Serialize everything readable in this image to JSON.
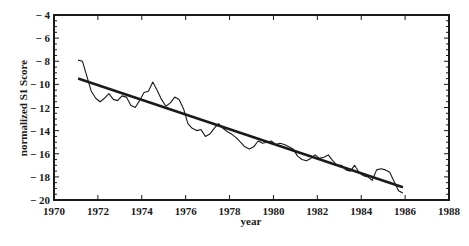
{
  "chart_data": {
    "type": "line",
    "title": "",
    "xlabel": "year",
    "ylabel": "normalized S1 Score",
    "xlim": [
      1970,
      1988
    ],
    "ylim": [
      -20,
      -4
    ],
    "xticks": [
      1970,
      1972,
      1974,
      1976,
      1978,
      1980,
      1982,
      1984,
      1986,
      1988
    ],
    "yticks": [
      -4,
      -6,
      -8,
      -10,
      -12,
      -14,
      -16,
      -18,
      -20
    ],
    "grid": false,
    "legend": null,
    "series": [
      {
        "name": "S1 score",
        "style": "thin-line",
        "x": [
          1971.1,
          1971.3,
          1971.5,
          1971.7,
          1971.9,
          1972.1,
          1972.3,
          1972.5,
          1972.7,
          1972.9,
          1973.1,
          1973.3,
          1973.5,
          1973.7,
          1973.9,
          1974.1,
          1974.3,
          1974.5,
          1974.7,
          1974.9,
          1975.1,
          1975.3,
          1975.5,
          1975.7,
          1975.9,
          1976.1,
          1976.3,
          1976.5,
          1976.7,
          1976.9,
          1977.1,
          1977.3,
          1977.5,
          1977.7,
          1977.9,
          1978.1,
          1978.3,
          1978.5,
          1978.7,
          1978.9,
          1979.1,
          1979.3,
          1979.5,
          1979.7,
          1979.9,
          1980.1,
          1980.3,
          1980.5,
          1980.7,
          1980.9,
          1981.1,
          1981.3,
          1981.5,
          1981.7,
          1981.9,
          1982.1,
          1982.3,
          1982.5,
          1982.7,
          1982.9,
          1983.1,
          1983.3,
          1983.5,
          1983.7,
          1983.9,
          1984.1,
          1984.3,
          1984.5,
          1984.7,
          1984.9,
          1985.1,
          1985.3,
          1985.5,
          1985.7,
          1985.9
        ],
        "y": [
          -7.9,
          -8.0,
          -9.3,
          -10.6,
          -11.2,
          -11.5,
          -11.2,
          -10.8,
          -11.3,
          -11.4,
          -11.0,
          -11.1,
          -11.8,
          -12.0,
          -11.4,
          -10.7,
          -10.6,
          -9.8,
          -10.5,
          -11.3,
          -11.9,
          -11.6,
          -11.1,
          -11.3,
          -12.1,
          -13.4,
          -13.8,
          -14.0,
          -13.9,
          -14.5,
          -14.3,
          -13.8,
          -13.4,
          -13.8,
          -14.1,
          -14.3,
          -14.6,
          -15.0,
          -15.4,
          -15.6,
          -15.4,
          -14.9,
          -15.1,
          -15.0,
          -14.9,
          -15.2,
          -15.1,
          -15.2,
          -15.4,
          -15.6,
          -16.2,
          -16.5,
          -16.6,
          -16.4,
          -16.1,
          -16.4,
          -16.3,
          -16.1,
          -16.6,
          -17.0,
          -17.0,
          -17.4,
          -17.5,
          -17.0,
          -17.6,
          -17.9,
          -18.0,
          -18.3,
          -17.4,
          -17.3,
          -17.4,
          -17.6,
          -18.4,
          -19.2,
          -19.4
        ]
      },
      {
        "name": "linear fit",
        "style": "thick-line",
        "x": [
          1971.1,
          1985.9
        ],
        "y": [
          -9.5,
          -18.9
        ]
      }
    ]
  }
}
